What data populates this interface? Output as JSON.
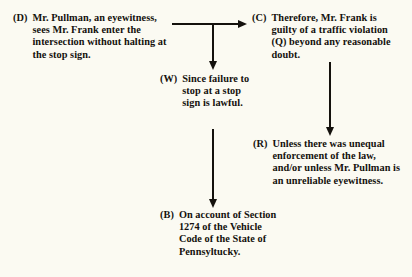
{
  "diagram": {
    "background_color": "#fbfaf2",
    "ink_color": "#14110d",
    "nodes": {
      "data": {
        "tag": "(D)",
        "text": "Mr. Pullman, an eyewitness, sees Mr. Frank enter the intersection without halting at the stop sign."
      },
      "claim": {
        "tag": "(C)",
        "text": "Therefore, Mr. Frank is guilty of a traffic violation (Q) beyond any reasonable doubt."
      },
      "warrant": {
        "tag": "(W)",
        "text": "Since failure to stop at a stop sign is lawful."
      },
      "rebuttal": {
        "tag": "(R)",
        "text": "Unless there was unequal enforcement of the law, and/or unless Mr. Pullman is an unreliable eyewitness."
      },
      "backing": {
        "tag": "(B)",
        "text": "On account of Section 1274 of the Vehicle Code of the State of Pennsyltucky."
      }
    },
    "connectors": [
      {
        "name": "data-to-claim",
        "from": "(D)",
        "to": "(C)",
        "direction": "right"
      },
      {
        "name": "junction-to-warrant",
        "from": "(D)-(C) junction",
        "to": "(W)",
        "direction": "down"
      },
      {
        "name": "warrant-to-backing",
        "from": "(W)",
        "to": "(B)",
        "direction": "down"
      },
      {
        "name": "claim-to-rebuttal",
        "from": "(C)",
        "to": "(R)",
        "direction": "down"
      }
    ]
  }
}
